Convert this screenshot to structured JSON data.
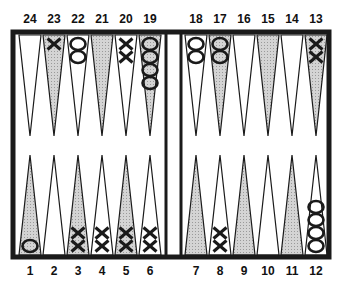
{
  "board": {
    "title": "Backgammon board position",
    "colors": {
      "frame": "#1a1a1a",
      "shaded_point": "#c8c8c8",
      "light_point": "#ffffff",
      "checker_stroke": "#1a1a1a"
    }
  },
  "top_numbers": [
    "24",
    "23",
    "22",
    "21",
    "20",
    "19",
    "18",
    "17",
    "16",
    "15",
    "14",
    "13"
  ],
  "bottom_numbers": [
    "1",
    "2",
    "3",
    "4",
    "5",
    "6",
    "7",
    "8",
    "9",
    "10",
    "11",
    "12"
  ],
  "points": [
    {
      "point": 24,
      "row": "top",
      "shaded": false,
      "checkers": []
    },
    {
      "point": 23,
      "row": "top",
      "shaded": true,
      "checkers": [
        "X"
      ]
    },
    {
      "point": 22,
      "row": "top",
      "shaded": false,
      "checkers": [
        "O",
        "O"
      ]
    },
    {
      "point": 21,
      "row": "top",
      "shaded": true,
      "checkers": []
    },
    {
      "point": 20,
      "row": "top",
      "shaded": false,
      "checkers": [
        "X",
        "X"
      ]
    },
    {
      "point": 19,
      "row": "top",
      "shaded": true,
      "checkers": [
        "O",
        "O",
        "O",
        "O"
      ]
    },
    {
      "point": 18,
      "row": "top",
      "shaded": false,
      "checkers": [
        "O",
        "O"
      ]
    },
    {
      "point": 17,
      "row": "top",
      "shaded": true,
      "checkers": [
        "O",
        "O"
      ]
    },
    {
      "point": 16,
      "row": "top",
      "shaded": false,
      "checkers": []
    },
    {
      "point": 15,
      "row": "top",
      "shaded": true,
      "checkers": []
    },
    {
      "point": 14,
      "row": "top",
      "shaded": false,
      "checkers": []
    },
    {
      "point": 13,
      "row": "top",
      "shaded": true,
      "checkers": [
        "X",
        "X"
      ]
    },
    {
      "point": 1,
      "row": "bottom",
      "shaded": true,
      "checkers": [
        "O"
      ]
    },
    {
      "point": 2,
      "row": "bottom",
      "shaded": false,
      "checkers": []
    },
    {
      "point": 3,
      "row": "bottom",
      "shaded": true,
      "checkers": [
        "X",
        "X"
      ]
    },
    {
      "point": 4,
      "row": "bottom",
      "shaded": false,
      "checkers": [
        "X",
        "X"
      ]
    },
    {
      "point": 5,
      "row": "bottom",
      "shaded": true,
      "checkers": [
        "X",
        "X"
      ]
    },
    {
      "point": 6,
      "row": "bottom",
      "shaded": false,
      "checkers": [
        "X",
        "X"
      ]
    },
    {
      "point": 7,
      "row": "bottom",
      "shaded": true,
      "checkers": []
    },
    {
      "point": 8,
      "row": "bottom",
      "shaded": false,
      "checkers": [
        "X",
        "X"
      ]
    },
    {
      "point": 9,
      "row": "bottom",
      "shaded": true,
      "checkers": []
    },
    {
      "point": 10,
      "row": "bottom",
      "shaded": false,
      "checkers": []
    },
    {
      "point": 11,
      "row": "bottom",
      "shaded": true,
      "checkers": []
    },
    {
      "point": 12,
      "row": "bottom",
      "shaded": false,
      "checkers": [
        "O",
        "O",
        "O",
        "O"
      ]
    }
  ]
}
